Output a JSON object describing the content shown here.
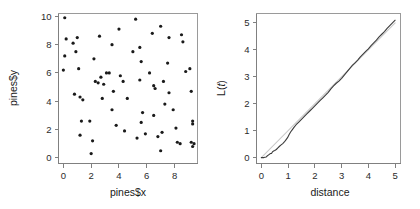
{
  "figure": {
    "panels": [
      "scatter",
      "lfunction"
    ],
    "background": "#ffffff",
    "point_color": "#1a1a1a",
    "observed_color": "#3c3c3c",
    "theoretical_color": "#c9c9c9",
    "axis_color": "#808080"
  },
  "chart_data": [
    {
      "type": "scatter",
      "title": "",
      "xlabel": "pines$x",
      "ylabel": "pines$y",
      "xlim": [
        -0.35,
        9.65
      ],
      "ylim": [
        -0.4,
        10.2
      ],
      "xticks": [
        0,
        2,
        4,
        6,
        8
      ],
      "yticks": [
        0,
        2,
        4,
        6,
        8,
        10
      ],
      "xticklabels": [
        "0",
        "2",
        "4",
        "6",
        "8"
      ],
      "yticklabels": [
        "0",
        "2",
        "4",
        "6",
        "8",
        "10"
      ],
      "grid": false,
      "legend": "none",
      "marker": "filled-circle",
      "n_points": 71,
      "points": [
        [
          0.1,
          9.9
        ],
        [
          0.2,
          8.4
        ],
        [
          0.1,
          7.2
        ],
        [
          0.0,
          6.2
        ],
        [
          0.7,
          8.1
        ],
        [
          1.0,
          8.5
        ],
        [
          0.9,
          7.5
        ],
        [
          1.1,
          6.3
        ],
        [
          0.8,
          4.5
        ],
        [
          1.2,
          4.3
        ],
        [
          1.4,
          4.1
        ],
        [
          1.3,
          2.6
        ],
        [
          1.2,
          1.6
        ],
        [
          2.0,
          0.3
        ],
        [
          2.1,
          1.2
        ],
        [
          1.9,
          2.6
        ],
        [
          2.3,
          5.4
        ],
        [
          2.2,
          7.0
        ],
        [
          2.6,
          8.6
        ],
        [
          2.7,
          5.7
        ],
        [
          2.5,
          5.3
        ],
        [
          2.9,
          5.2
        ],
        [
          2.8,
          4.2
        ],
        [
          3.1,
          6.0
        ],
        [
          3.3,
          6.0
        ],
        [
          3.5,
          8.0
        ],
        [
          3.6,
          4.7
        ],
        [
          3.5,
          3.4
        ],
        [
          3.8,
          2.3
        ],
        [
          4.0,
          9.1
        ],
        [
          4.1,
          5.8
        ],
        [
          4.3,
          5.4
        ],
        [
          4.4,
          1.9
        ],
        [
          4.6,
          4.2
        ],
        [
          5.0,
          7.5
        ],
        [
          5.2,
          9.8
        ],
        [
          5.3,
          1.4
        ],
        [
          5.5,
          7.8
        ],
        [
          5.6,
          6.8
        ],
        [
          5.5,
          5.5
        ],
        [
          5.7,
          3.2
        ],
        [
          5.6,
          2.5
        ],
        [
          5.9,
          1.7
        ],
        [
          6.2,
          6.0
        ],
        [
          6.4,
          8.8
        ],
        [
          6.5,
          5.1
        ],
        [
          6.6,
          4.9
        ],
        [
          6.5,
          3.0
        ],
        [
          6.8,
          1.5
        ],
        [
          7.0,
          9.3
        ],
        [
          7.0,
          0.5
        ],
        [
          7.1,
          1.8
        ],
        [
          7.2,
          5.4
        ],
        [
          7.3,
          3.8
        ],
        [
          7.5,
          6.7
        ],
        [
          7.6,
          8.5
        ],
        [
          7.6,
          4.6
        ],
        [
          7.9,
          3.4
        ],
        [
          8.1,
          2.1
        ],
        [
          8.2,
          1.1
        ],
        [
          8.4,
          1.0
        ],
        [
          8.5,
          8.7
        ],
        [
          8.6,
          8.2
        ],
        [
          8.8,
          6.1
        ],
        [
          9.1,
          6.3
        ],
        [
          9.2,
          4.7
        ],
        [
          9.3,
          2.6
        ],
        [
          9.3,
          2.4
        ],
        [
          9.2,
          1.1
        ],
        [
          9.4,
          1.0
        ],
        [
          9.3,
          0.8
        ]
      ]
    },
    {
      "type": "line",
      "title": "",
      "xlabel": "distance",
      "ylabel": "L(t)",
      "ylabel_parts": {
        "prefix": "L(",
        "italic": "t",
        "suffix": ")"
      },
      "xlim": [
        -0.18,
        5.2
      ],
      "ylim": [
        -0.22,
        5.35
      ],
      "xticks": [
        0,
        1,
        2,
        3,
        4,
        5
      ],
      "yticks": [
        0,
        1,
        2,
        3,
        4,
        5
      ],
      "xticklabels": [
        "0",
        "1",
        "2",
        "3",
        "4",
        "5"
      ],
      "yticklabels": [
        "0",
        "1",
        "2",
        "3",
        "4",
        "5"
      ],
      "grid": false,
      "legend": "none",
      "series": [
        {
          "name": "theoretical",
          "style": "solid-light",
          "color": "#c9c9c9",
          "x": [
            0,
            5
          ],
          "values": [
            0,
            5
          ]
        },
        {
          "name": "observed",
          "style": "solid",
          "color": "#3c3c3c",
          "x": [
            0.0,
            0.1,
            0.18,
            0.22,
            0.26,
            0.3,
            0.34,
            0.38,
            0.42,
            0.46,
            0.5,
            0.56,
            0.62,
            0.68,
            0.74,
            0.8,
            0.86,
            0.92,
            0.98,
            1.04,
            1.1,
            1.16,
            1.22,
            1.3,
            1.4,
            1.5,
            1.6,
            1.7,
            1.8,
            1.9,
            2.0,
            2.1,
            2.2,
            2.3,
            2.4,
            2.5,
            2.6,
            2.7,
            2.8,
            2.9,
            3.0,
            3.1,
            3.2,
            3.3,
            3.4,
            3.5,
            3.6,
            3.7,
            3.8,
            3.9,
            4.0,
            4.1,
            4.2,
            4.3,
            4.4,
            4.5,
            4.6,
            4.7,
            4.8,
            4.9,
            5.0
          ],
          "values": [
            0.0,
            0.0,
            0.02,
            0.06,
            0.09,
            0.12,
            0.15,
            0.15,
            0.22,
            0.24,
            0.26,
            0.3,
            0.36,
            0.42,
            0.47,
            0.52,
            0.58,
            0.66,
            0.74,
            0.86,
            0.96,
            1.04,
            1.12,
            1.22,
            1.32,
            1.42,
            1.52,
            1.62,
            1.72,
            1.82,
            1.92,
            2.02,
            2.12,
            2.22,
            2.32,
            2.42,
            2.55,
            2.66,
            2.76,
            2.84,
            2.94,
            3.06,
            3.18,
            3.3,
            3.42,
            3.52,
            3.62,
            3.74,
            3.84,
            3.94,
            4.04,
            4.16,
            4.26,
            4.36,
            4.48,
            4.58,
            4.68,
            4.8,
            4.9,
            5.0,
            5.1
          ]
        }
      ]
    }
  ]
}
